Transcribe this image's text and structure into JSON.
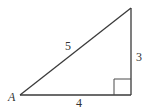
{
  "diagram": {
    "type": "right-triangle",
    "vertices": {
      "A": {
        "label": "A",
        "x": 20,
        "y": 95
      },
      "right_angle": {
        "label": "",
        "x": 131,
        "y": 95
      },
      "top": {
        "label": "",
        "x": 131,
        "y": 8
      }
    },
    "sides": {
      "hypotenuse": {
        "label": "5",
        "x": 68,
        "y": 50
      },
      "vertical": {
        "label": "3",
        "x": 137,
        "y": 60
      },
      "horizontal": {
        "label": "4",
        "x": 76,
        "y": 106
      }
    },
    "vertex_label_A": "A",
    "right_angle_marker_size": 17,
    "stroke_color": "#3a3a3a",
    "background_color": "#ffffff"
  }
}
